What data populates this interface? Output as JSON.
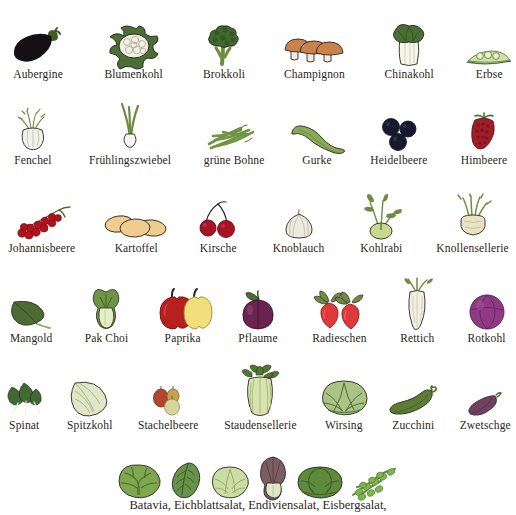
{
  "page": {
    "background_color": "#ffffff",
    "text_color": "#2a2520"
  },
  "palette": {
    "aubergine": "#141014",
    "cauliflower_curd": "#f3f1e4",
    "leaf_green": "#4a6f34",
    "dark_leaf_green": "#3d5c2a",
    "broccoli_green": "#3f6b2e",
    "mushroom_tan": "#c8824a",
    "mushroom_stem": "#f2ece0",
    "pale_green": "#dfe8c5",
    "pea_green": "#cfe0a8",
    "fennel_white": "#f1f2ea",
    "onion_white": "#f6f6f0",
    "bean_green": "#6f9442",
    "cucumber_green": "#8aab55",
    "blueberry": "#171a2e",
    "raspberry": "#9c1f2a",
    "currant_red": "#b3121d",
    "potato_tan": "#f0cd8e",
    "cherry_red": "#a81324",
    "garlic_white": "#eceade",
    "kohlrabi_green": "#c8d98f",
    "celeriac_cream": "#e8e3c2",
    "chard_green": "#4d6b33",
    "pakchoi_pale": "#e3efc6",
    "pepper_red": "#b81f1f",
    "pepper_yellow": "#f2de7a",
    "plum_purple": "#6b2352",
    "radish_red": "#e0393c",
    "daikon_white": "#f1efe4",
    "red_cabbage": "#8e3a86",
    "spinach_green": "#3f6b33",
    "pointed_cabbage": "#dfe7c6",
    "gooseberry_red": "#b4452c",
    "gooseberry_green": "#d8d79a",
    "celery_pale": "#d9e3b0",
    "savoy_green": "#a9c484",
    "zucchini_green": "#5d7d34",
    "damson_purple": "#70425f",
    "lettuce_green": "#7fa84e",
    "radicchio_purple": "#7d5c63",
    "iceberg_pale": "#cfe0a7",
    "outline": "#2a2520"
  },
  "rows": [
    {
      "id": "row-1",
      "gap": 16,
      "items": [
        {
          "label": "Aubergine",
          "icon": "aubergine-illustration",
          "width": 88
        },
        {
          "label": "Blumenkohl",
          "icon": "cauliflower-illustration",
          "width": 96
        },
        {
          "label": "Brokkoli",
          "icon": "broccoli-illustration",
          "width": 76
        },
        {
          "label": "Champignon",
          "icon": "mushroom-illustration",
          "width": 96
        },
        {
          "label": "Chinakohl",
          "icon": "napa-cabbage-illustration",
          "width": 86
        },
        {
          "label": "Erbse",
          "icon": "pea-pod-illustration",
          "width": 62
        }
      ]
    },
    {
      "id": "row-2",
      "gap": 14,
      "items": [
        {
          "label": "Fenchel",
          "icon": "fennel-illustration",
          "width": 76
        },
        {
          "label": "Frühlingszwiebel",
          "icon": "spring-onion-illustration",
          "width": 116
        },
        {
          "label": "grüne Bohne",
          "icon": "green-bean-illustration",
          "width": 92
        },
        {
          "label": "Gurke",
          "icon": "cucumber-illustration",
          "width": 66
        },
        {
          "label": "Heidelbeere",
          "icon": "blueberry-illustration",
          "width": 90
        },
        {
          "label": "Himbeere",
          "icon": "raspberry-illustration",
          "width": 74
        }
      ]
    },
    {
      "id": "row-3",
      "gap": 16,
      "items": [
        {
          "label": "Johannisbeere",
          "icon": "redcurrant-illustration",
          "width": 100
        },
        {
          "label": "Kartoffel",
          "icon": "potato-illustration",
          "width": 88
        },
        {
          "label": "Kirsche",
          "icon": "cherry-illustration",
          "width": 70
        },
        {
          "label": "Knoblauch",
          "icon": "garlic-illustration",
          "width": 84
        },
        {
          "label": "Kohlrabi",
          "icon": "kohlrabi-illustration",
          "width": 76
        },
        {
          "label": "Knollensellerie",
          "icon": "celeriac-illustration",
          "width": 104
        }
      ]
    },
    {
      "id": "row-4",
      "gap": 13,
      "items": [
        {
          "label": "Mangold",
          "icon": "chard-illustration",
          "width": 72
        },
        {
          "label": "Pak Choi",
          "icon": "pak-choi-illustration",
          "width": 72
        },
        {
          "label": "Paprika",
          "icon": "pepper-illustration",
          "width": 74
        },
        {
          "label": "Pflaume",
          "icon": "plum-illustration",
          "width": 70
        },
        {
          "label": "Radieschen",
          "icon": "radish-illustration",
          "width": 88
        },
        {
          "label": "Rettich",
          "icon": "daikon-illustration",
          "width": 62
        },
        {
          "label": "Rotkohl",
          "icon": "red-cabbage-illustration",
          "width": 68
        }
      ]
    },
    {
      "id": "row-5",
      "gap": 13,
      "items": [
        {
          "label": "Spinat",
          "icon": "spinach-illustration",
          "width": 60
        },
        {
          "label": "Spitzkohl",
          "icon": "pointed-cabbage-illustration",
          "width": 70
        },
        {
          "label": "Stachelbeere",
          "icon": "gooseberry-illustration",
          "width": 92
        },
        {
          "label": "Staudensellerie",
          "icon": "celery-illustration",
          "width": 104
        },
        {
          "label": "Wirsing",
          "icon": "savoy-cabbage-illustration",
          "width": 70
        },
        {
          "label": "Zucchini",
          "icon": "zucchini-illustration",
          "width": 70
        },
        {
          "label": "Zwetschge",
          "icon": "damson-illustration",
          "width": 76
        }
      ]
    },
    {
      "id": "row-6",
      "gap": 4,
      "items": [
        {
          "label": "",
          "icon": "batavia-lettuce-illustration",
          "width": 46
        },
        {
          "label": "",
          "icon": "oakleaf-lettuce-illustration",
          "width": 40
        },
        {
          "label": "",
          "icon": "endive-lettuce-illustration",
          "width": 40
        },
        {
          "label": "",
          "icon": "radicchio-illustration",
          "width": 38
        },
        {
          "label": "",
          "icon": "iceberg-lettuce-illustration",
          "width": 48
        },
        {
          "label": "",
          "icon": "frisee-lettuce-illustration",
          "width": 52
        }
      ]
    }
  ],
  "caption": {
    "text": "Batavia, Eichblattsalat, Endiviensalat, Eisbergsalat,"
  }
}
